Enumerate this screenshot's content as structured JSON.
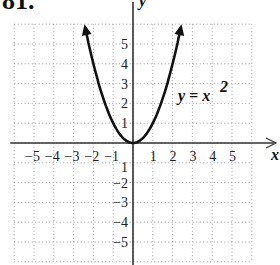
{
  "problem_number": "81.",
  "chart_data": {
    "type": "line",
    "title": "",
    "function": "y = x^2",
    "label": "y = x",
    "label_exponent": "2",
    "xlabel": "x",
    "ylabel": "y",
    "xlim": [
      -6,
      6
    ],
    "ylim": [
      -6,
      6
    ],
    "grid": true,
    "grid_style": "dotted",
    "x_ticks": [
      "−5",
      "−4",
      "−3",
      "−2",
      "−1",
      "1",
      "2",
      "3",
      "4",
      "5"
    ],
    "y_ticks": [
      "5",
      "4",
      "3",
      "2",
      "1",
      "−1",
      "−2",
      "−3",
      "−4",
      "−5"
    ],
    "series": [
      {
        "name": "y = x^2",
        "x": [
          -2.4,
          -2,
          -1.5,
          -1,
          -0.5,
          0,
          0.5,
          1,
          1.5,
          2,
          2.4
        ],
        "y": [
          5.76,
          4,
          2.25,
          1,
          0.25,
          0,
          0.25,
          1,
          2.25,
          4,
          5.76
        ]
      }
    ],
    "arrows": "both ends of curve and positive axes"
  }
}
